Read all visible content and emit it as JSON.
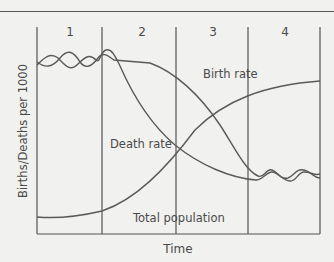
{
  "diagram": {
    "stages": [
      "1",
      "2",
      "3",
      "4"
    ],
    "xlabel": "Time",
    "ylabel": "Births/Deaths per 1000",
    "curve_labels": {
      "birth_rate": "Birth rate",
      "death_rate": "Death rate",
      "total_population": "Total population"
    },
    "colors": {
      "background": "#f1f1f0",
      "line": "#555555",
      "text": "#4a4a4a"
    }
  }
}
